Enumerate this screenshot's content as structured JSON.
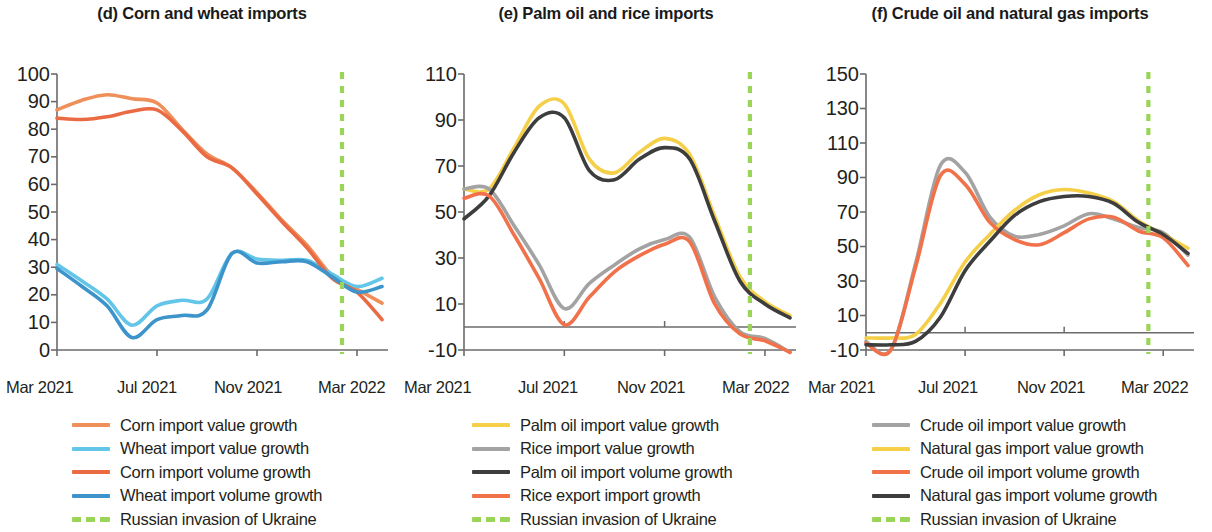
{
  "figure": {
    "panels": [
      {
        "id": "panel-d",
        "title": "(d) Corn and wheat imports",
        "y_axis": {
          "ticks": [
            "100",
            "90",
            "80",
            "70",
            "60",
            "50",
            "40",
            "30",
            "20",
            "10",
            "0"
          ],
          "min": 0,
          "max": 100
        },
        "x_axis": {
          "ticks": [
            "Mar 2021",
            "Jul 2021",
            "Nov 2021",
            "Mar 2022"
          ]
        },
        "legend": [
          {
            "label": "Corn import value growth",
            "color": "#ef8f5a",
            "style": "solid"
          },
          {
            "label": "Wheat import value growth",
            "color": "#63c6e8",
            "style": "solid"
          },
          {
            "label": "Corn import volume growth",
            "color": "#ea6a43",
            "style": "solid"
          },
          {
            "label": "Wheat import volume growth",
            "color": "#3c94cb",
            "style": "solid"
          },
          {
            "label": "Russian invasion of Ukraine",
            "color": "#9ad558",
            "style": "dashed"
          }
        ]
      },
      {
        "id": "panel-e",
        "title": "(e) Palm oil and rice imports",
        "y_axis": {
          "ticks": [
            "110",
            "90",
            "70",
            "50",
            "30",
            "10",
            "-10"
          ],
          "min": -10,
          "max": 110
        },
        "x_axis": {
          "ticks": [
            "Mar 2021",
            "Jul 2021",
            "Nov 2021",
            "Mar 2022"
          ]
        },
        "legend": [
          {
            "label": "Palm oil import value growth",
            "color": "#f5cf47",
            "style": "solid"
          },
          {
            "label": "Rice import value growth",
            "color": "#a3a3a3",
            "style": "solid"
          },
          {
            "label": "Palm oil import volume growth",
            "color": "#3d3d3d",
            "style": "solid"
          },
          {
            "label": "Rice export import growth",
            "color": "#f0714a",
            "style": "solid"
          },
          {
            "label": "Russian invasion of Ukraine",
            "color": "#9ad558",
            "style": "dashed"
          }
        ]
      },
      {
        "id": "panel-f",
        "title": "(f) Crude oil and natural gas imports",
        "y_axis": {
          "ticks": [
            "150",
            "130",
            "110",
            "90",
            "70",
            "50",
            "30",
            "10",
            "-10"
          ],
          "min": -10,
          "max": 150
        },
        "x_axis": {
          "ticks": [
            "Mar 2021",
            "Jul 2021",
            "Nov 2021",
            "Mar 2022"
          ]
        },
        "legend": [
          {
            "label": "Crude oil import value growth",
            "color": "#a3a3a3",
            "style": "solid"
          },
          {
            "label": "Natural gas import value growth",
            "color": "#f5cf47",
            "style": "solid"
          },
          {
            "label": "Crude oil import volume growth",
            "color": "#f0714a",
            "style": "solid"
          },
          {
            "label": "Natural gas import volume growth",
            "color": "#3d3d3d",
            "style": "solid"
          },
          {
            "label": "Russian invasion of Ukraine",
            "color": "#9ad558",
            "style": "dashed"
          }
        ]
      }
    ]
  },
  "chart_data": [
    {
      "panel": "(d)",
      "type": "line",
      "title": "(d) Corn and wheat imports",
      "xlabel": "",
      "ylabel": "",
      "ylim": [
        0,
        100
      ],
      "yticks": [
        0,
        10,
        20,
        30,
        40,
        50,
        60,
        70,
        80,
        90,
        100
      ],
      "xticks": [
        "Mar 2021",
        "Jul 2021",
        "Nov 2021",
        "Mar 2022"
      ],
      "x": [
        "Mar 2021",
        "Apr 2021",
        "May 2021",
        "Jun 2021",
        "Jul 2021",
        "Aug 2021",
        "Sep 2021",
        "Oct 2021",
        "Nov 2021",
        "Dec 2021",
        "Jan 2022",
        "Feb 2022",
        "Mar 2022",
        "Apr 2022"
      ],
      "grid": false,
      "legend_position": "below",
      "annotations": [
        {
          "text": "Russian invasion of Ukraine",
          "type": "vline",
          "x": "Feb 2022",
          "color": "#9ad558",
          "style": "dashed"
        }
      ],
      "series": [
        {
          "name": "Corn import value growth",
          "color": "#ef8f5a",
          "values": [
            87,
            90.5,
            92.5,
            91,
            89.5,
            80,
            71,
            66,
            57,
            47,
            38,
            27,
            22,
            17
          ]
        },
        {
          "name": "Wheat import value growth",
          "color": "#63c6e8",
          "values": [
            31,
            25,
            18.5,
            9,
            16,
            18,
            18.5,
            35,
            33,
            32.5,
            32.5,
            27.5,
            23,
            26
          ]
        },
        {
          "name": "Corn import volume growth",
          "color": "#ea6a43",
          "values": [
            84,
            83.5,
            84.5,
            86.5,
            87,
            79.5,
            70,
            66,
            56.5,
            46.5,
            37,
            26,
            21,
            11
          ]
        },
        {
          "name": "Wheat import volume growth",
          "color": "#3c94cb",
          "values": [
            29.5,
            23,
            16,
            4.5,
            11,
            12.5,
            14.5,
            35,
            31.5,
            32,
            32,
            26.5,
            21,
            23
          ]
        }
      ]
    },
    {
      "panel": "(e)",
      "type": "line",
      "title": "(e) Palm oil and rice imports",
      "xlabel": "",
      "ylabel": "",
      "ylim": [
        -10,
        110
      ],
      "yticks": [
        -10,
        10,
        30,
        50,
        70,
        90,
        110
      ],
      "xticks": [
        "Mar 2021",
        "Jul 2021",
        "Nov 2021",
        "Mar 2022"
      ],
      "x": [
        "Mar 2021",
        "Apr 2021",
        "May 2021",
        "Jun 2021",
        "Jul 2021",
        "Aug 2021",
        "Sep 2021",
        "Oct 2021",
        "Nov 2021",
        "Dec 2021",
        "Jan 2022",
        "Feb 2022",
        "Mar 2022",
        "Apr 2022"
      ],
      "grid": false,
      "zero_line": true,
      "legend_position": "below",
      "annotations": [
        {
          "text": "Russian invasion of Ukraine",
          "type": "vline",
          "x": "Feb 2022",
          "color": "#9ad558",
          "style": "dashed"
        }
      ],
      "series": [
        {
          "name": "Palm oil import value growth",
          "color": "#f5cf47",
          "values": [
            60,
            60,
            78,
            96,
            97,
            73,
            67,
            76,
            82,
            75,
            48,
            22,
            11,
            5
          ]
        },
        {
          "name": "Rice import value growth",
          "color": "#a3a3a3",
          "values": [
            60,
            60,
            44,
            27,
            8,
            19,
            27,
            34,
            38,
            39,
            13,
            -2,
            -5,
            -11
          ]
        },
        {
          "name": "Palm oil import volume growth",
          "color": "#3d3d3d",
          "values": [
            47,
            57,
            76,
            91,
            91,
            68,
            64,
            73,
            78,
            73,
            46,
            20,
            10,
            4
          ]
        },
        {
          "name": "Rice export import growth",
          "color": "#f0714a",
          "values": [
            56,
            57,
            40,
            21,
            1,
            13,
            24,
            31,
            36,
            37,
            10,
            -3,
            -6,
            -11
          ]
        }
      ]
    },
    {
      "panel": "(f)",
      "type": "line",
      "title": "(f) Crude oil and natural gas imports",
      "xlabel": "",
      "ylabel": "",
      "ylim": [
        -10,
        150
      ],
      "yticks": [
        -10,
        10,
        30,
        50,
        70,
        90,
        110,
        130,
        150
      ],
      "xticks": [
        "Mar 2021",
        "Jul 2021",
        "Nov 2021",
        "Mar 2022"
      ],
      "x": [
        "Mar 2021",
        "Apr 2021",
        "May 2021",
        "Jun 2021",
        "Jul 2021",
        "Aug 2021",
        "Sep 2021",
        "Oct 2021",
        "Nov 2021",
        "Dec 2021",
        "Jan 2022",
        "Feb 2022",
        "Mar 2022",
        "Apr 2022"
      ],
      "grid": false,
      "zero_line": true,
      "legend_position": "below",
      "annotations": [
        {
          "text": "Russian invasion of Ukraine",
          "type": "vline",
          "x": "Feb 2022",
          "color": "#9ad558",
          "style": "dashed"
        }
      ],
      "series": [
        {
          "name": "Crude oil import value growth",
          "color": "#a3a3a3",
          "values": [
            -5,
            -10,
            40,
            97,
            93,
            67,
            56,
            57,
            62,
            69,
            66,
            61,
            58,
            45
          ]
        },
        {
          "name": "Natural gas import value growth",
          "color": "#f5cf47",
          "values": [
            -3,
            -3,
            -1,
            17,
            41,
            57,
            71,
            80,
            83,
            81,
            76,
            65,
            57,
            49
          ]
        },
        {
          "name": "Crude oil import volume growth",
          "color": "#f0714a",
          "values": [
            -6,
            -10,
            38,
            91,
            86,
            64,
            54,
            51,
            58,
            66,
            67,
            59,
            55,
            39
          ]
        },
        {
          "name": "Natural gas import volume growth",
          "color": "#3d3d3d",
          "values": [
            -7,
            -7,
            -5,
            9,
            36,
            53,
            68,
            76,
            79,
            79,
            75,
            64,
            57,
            46
          ]
        }
      ]
    }
  ]
}
